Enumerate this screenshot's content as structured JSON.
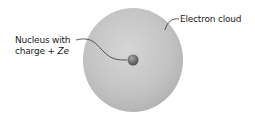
{
  "diagram": {
    "labels": {
      "nucleus_line1": "Nucleus with",
      "nucleus_line2_prefix": "charge + ",
      "nucleus_line2_var": "Ze",
      "cloud": "Electron cloud"
    },
    "colors": {
      "cloud": "#c4c4c4",
      "nucleus": "#6f6f6f",
      "leader": "#333333"
    }
  }
}
